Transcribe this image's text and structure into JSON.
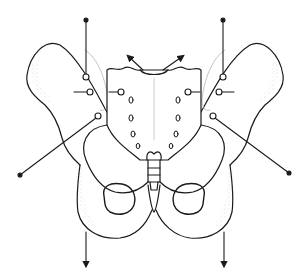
{
  "diagram": {
    "style": "black line drawing with stippled shading",
    "colors": {
      "line": "#1a1a1a",
      "stipple": "#9a9a9a",
      "background": "#ffffff"
    },
    "pointers": [
      {
        "id": "left-iliac-crest-pointer",
        "type": "dot-line",
        "from": [
          86,
          20
        ],
        "to": [
          86,
          76
        ]
      },
      {
        "id": "right-iliac-crest-pointer",
        "type": "dot-line",
        "from": [
          223,
          20
        ],
        "to": [
          223,
          76
        ]
      },
      {
        "id": "left-ilium-mid-pointer",
        "type": "line",
        "from": [
          74,
          92
        ],
        "to": [
          90,
          92
        ]
      },
      {
        "id": "left-si-pointer",
        "type": "line",
        "from": [
          107,
          92
        ],
        "to": [
          121,
          92
        ]
      },
      {
        "id": "right-si-pointer",
        "type": "line",
        "from": [
          188,
          92
        ],
        "to": [
          200,
          92
        ]
      },
      {
        "id": "right-ilium-mid-pointer",
        "type": "line",
        "from": [
          219,
          92
        ],
        "to": [
          234,
          92
        ]
      },
      {
        "id": "left-asis-pointer",
        "type": "dot-line",
        "from": [
          20,
          175
        ],
        "to": [
          98,
          116
        ]
      },
      {
        "id": "right-asis-pointer",
        "type": "dot-line",
        "from": [
          289,
          173
        ],
        "to": [
          213,
          116
        ]
      },
      {
        "id": "sacrum-left-arrow",
        "type": "arrow",
        "from": [
          143,
          70
        ],
        "to": [
          127,
          55
        ]
      },
      {
        "id": "sacrum-right-arrow",
        "type": "arrow",
        "from": [
          161,
          70
        ],
        "to": [
          185,
          55
        ]
      },
      {
        "id": "left-ischium-arrow",
        "type": "arrow",
        "from": [
          86,
          232
        ],
        "to": [
          86,
          268
        ]
      },
      {
        "id": "right-ischium-arrow",
        "type": "arrow",
        "from": [
          224,
          232
        ],
        "to": [
          224,
          268
        ]
      }
    ]
  }
}
